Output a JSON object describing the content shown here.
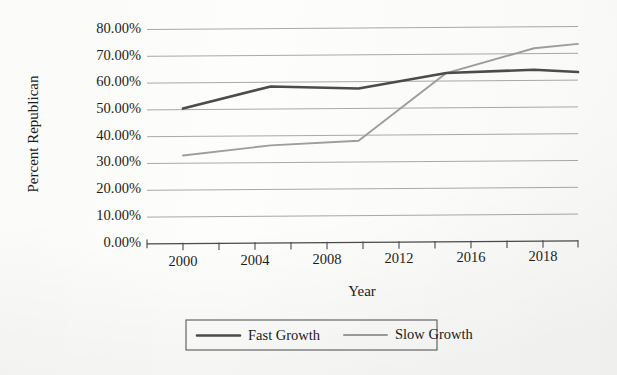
{
  "chart_data": {
    "type": "line",
    "title": "",
    "xlabel": "Year",
    "ylabel": "Percent Republican",
    "categories": [
      "2000",
      "2004",
      "2008",
      "2012",
      "2016",
      "2018"
    ],
    "x": [
      2000,
      2004,
      2008,
      2012,
      2016,
      2018
    ],
    "xlim": [
      2000,
      2018
    ],
    "ylim": [
      0,
      80
    ],
    "ytick_labels": [
      "0.00%",
      "10.00%",
      "20.00%",
      "30.00%",
      "40.00%",
      "50.00%",
      "60.00%",
      "70.00%",
      "80.00%"
    ],
    "ytick_values": [
      0,
      10,
      20,
      30,
      40,
      50,
      60,
      70,
      80
    ],
    "xtick_labels": [
      "2000",
      "2004",
      "2008",
      "2012",
      "2016",
      "2018"
    ],
    "grid": "horizontal",
    "legend_position": "bottom",
    "series": [
      {
        "name": "Fast Growth",
        "color": "#4c4c4c",
        "values": [
          50.5,
          58.5,
          57.5,
          63.0,
          64.0,
          63.0
        ]
      },
      {
        "name": "Slow Growth",
        "color": "#9e9e9e",
        "values": [
          33.0,
          36.5,
          38.0,
          63.0,
          72.0,
          73.5
        ]
      }
    ],
    "annotations": []
  },
  "axes": {
    "y_title": "Percent Republican",
    "x_title": "Year",
    "y_ticks": [
      "80.00%",
      "70.00%",
      "60.00%",
      "50.00%",
      "40.00%",
      "30.00%",
      "20.00%",
      "10.00%",
      "0.00%"
    ],
    "x_ticks": [
      "2000",
      "2004",
      "2008",
      "2012",
      "2016",
      "2018"
    ]
  },
  "legend": {
    "items": [
      {
        "label": "Fast Growth",
        "color": "#4c4c4c"
      },
      {
        "label": "Slow Growth",
        "color": "#9e9e9e"
      }
    ]
  }
}
